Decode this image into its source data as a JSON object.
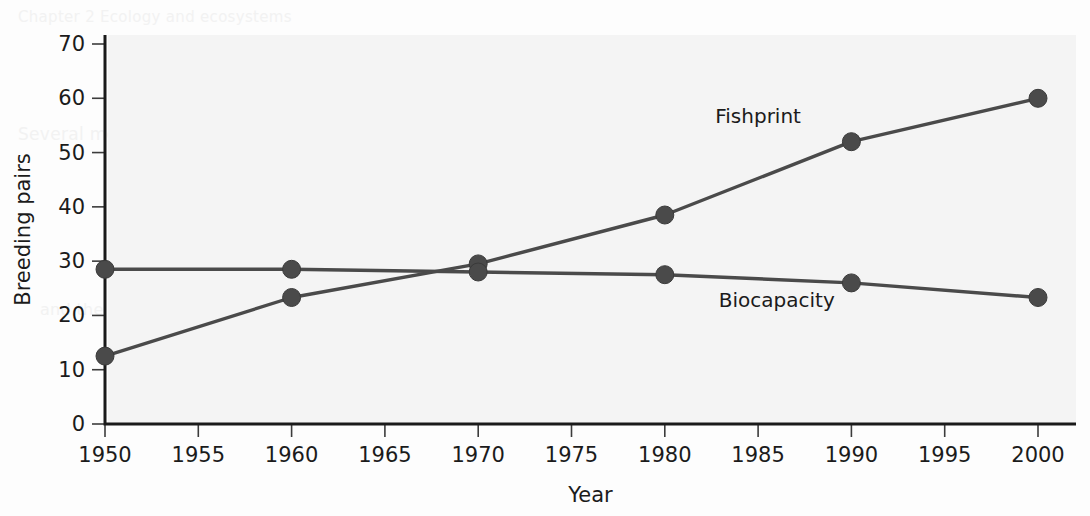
{
  "figure": {
    "background_color": "#fdfdfd",
    "plot_background_color": "#f4f4f4",
    "axis_color": "#1a1a1a",
    "series_color": "#4a4a4a"
  },
  "ghost_text": [
    {
      "text": "Chapter 2  Ecology and ecosystems",
      "x": 18,
      "y": 8,
      "size": 15
    },
    {
      "text": "populations. Changes in fish stocks over time",
      "x": 120,
      "y": 52,
      "size": 17
    },
    {
      "text": "can be monitored. Fish populations are affected",
      "x": 600,
      "y": 52,
      "size": 17
    },
    {
      "text": "by many factors. These changes reflect both",
      "x": 600,
      "y": 76,
      "size": 17
    },
    {
      "text": "natural variation and the effects of fishing.",
      "x": 600,
      "y": 100,
      "size": 17
    },
    {
      "text": "Several methods have been used to",
      "x": 18,
      "y": 124,
      "size": 17
    },
    {
      "text": "estimate the size of a population and its",
      "x": 600,
      "y": 188,
      "size": 17
    },
    {
      "text": "sustainable yield. Some species are more",
      "x": 600,
      "y": 212,
      "size": 17
    },
    {
      "text": "and the numbers of breeding pairs",
      "x": 40,
      "y": 300,
      "size": 16
    }
  ],
  "chart_data": {
    "type": "line",
    "title": "",
    "xlabel": "Year",
    "ylabel": "Breeding pairs",
    "xlim": [
      1950,
      2000
    ],
    "ylim": [
      0,
      70
    ],
    "grid": false,
    "legend_position": "inline-annotation",
    "x_ticks": [
      1950,
      1955,
      1960,
      1965,
      1970,
      1975,
      1980,
      1985,
      1990,
      1995,
      2000
    ],
    "y_ticks": [
      0,
      10,
      20,
      30,
      40,
      50,
      60,
      70
    ],
    "x": [
      1950,
      1960,
      1970,
      1980,
      1990,
      2000
    ],
    "series": [
      {
        "name": "Fishprint",
        "values": [
          12.5,
          23.3,
          29.5,
          38.5,
          52.0,
          60.0
        ],
        "color": "#4a4a4a",
        "label_x": 1985,
        "label_y": 55.5
      },
      {
        "name": "Biocapacity",
        "values": [
          28.5,
          28.5,
          28.0,
          27.5,
          26.0,
          23.3
        ],
        "color": "#4a4a4a",
        "label_x": 1986,
        "label_y": 21.5
      }
    ]
  }
}
